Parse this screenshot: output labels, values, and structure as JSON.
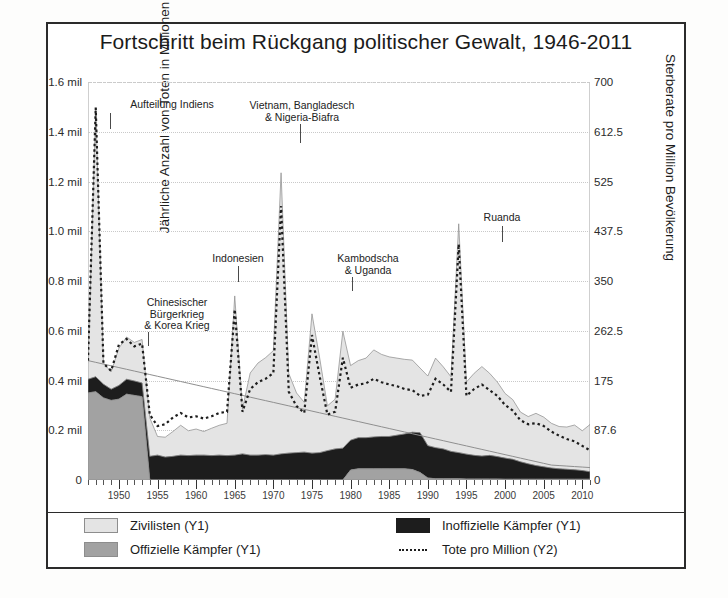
{
  "chart_data": {
    "type": "area",
    "title": "Fortschritt beim Rückgang politischer Gewalt, 1946-2011",
    "xlabel": "",
    "ylabel": "Jährliche Anzahl von Toten in Millionen",
    "ylabel_right": "Sterberate pro Million Bevölkerung",
    "xlim": [
      1946,
      2011
    ],
    "ylim": [
      0,
      1600000
    ],
    "ylim_right": [
      0,
      700
    ],
    "grid": true,
    "legend_position": "bottom",
    "y_ticks_left": [
      "0",
      "0.2 mil",
      "0.4 mil",
      "0.6 mil",
      "0.8 mil",
      "1.0 mil",
      "1.2 mil",
      "1.4 mil",
      "1.6 mil"
    ],
    "y_tick_values_left": [
      0,
      200000,
      400000,
      600000,
      800000,
      1000000,
      1200000,
      1400000,
      1600000
    ],
    "y_ticks_right": [
      "0",
      "87.6",
      "175",
      "262.5",
      "350",
      "437.5",
      "525",
      "612.5",
      "700"
    ],
    "y_tick_values_right": [
      0,
      87.6,
      175,
      262.5,
      350,
      437.5,
      525,
      612.5,
      700
    ],
    "x_ticks": [
      "1950",
      "1955",
      "1960",
      "1965",
      "1970",
      "1975",
      "1980",
      "1985",
      "1990",
      "1995",
      "2000",
      "2005",
      "2010"
    ],
    "x_tick_values": [
      1950,
      1955,
      1960,
      1965,
      1970,
      1975,
      1980,
      1985,
      1990,
      1995,
      2000,
      2005,
      2010
    ],
    "x": [
      1946,
      1947,
      1948,
      1949,
      1950,
      1951,
      1952,
      1953,
      1954,
      1955,
      1956,
      1957,
      1958,
      1959,
      1960,
      1961,
      1962,
      1963,
      1964,
      1965,
      1966,
      1967,
      1968,
      1969,
      1970,
      1971,
      1972,
      1973,
      1974,
      1975,
      1976,
      1977,
      1978,
      1979,
      1980,
      1981,
      1982,
      1983,
      1984,
      1985,
      1986,
      1987,
      1988,
      1989,
      1990,
      1991,
      1992,
      1993,
      1994,
      1995,
      1996,
      1997,
      1998,
      1999,
      2000,
      2001,
      2002,
      2003,
      2004,
      2005,
      2006,
      2007,
      2008,
      2009,
      2010,
      2011
    ],
    "series": [
      {
        "name": "Offizielle Kämpfer (Y1)",
        "key": "official",
        "color": "#a2a2a2",
        "axis": "Y1",
        "values": [
          350000,
          355000,
          330000,
          320000,
          325000,
          345000,
          340000,
          335000,
          0,
          0,
          0,
          0,
          0,
          0,
          0,
          0,
          0,
          0,
          0,
          0,
          0,
          0,
          0,
          0,
          0,
          0,
          0,
          0,
          0,
          0,
          0,
          0,
          0,
          0,
          40000,
          45000,
          45000,
          45000,
          45000,
          45000,
          45000,
          45000,
          42000,
          30000,
          8000,
          5000,
          5000,
          5000,
          5000,
          4000,
          4000,
          4000,
          4000,
          4000,
          3000,
          3000,
          3000,
          3000,
          3000,
          3000,
          3000,
          3000,
          3000,
          3000,
          3000,
          3000
        ]
      },
      {
        "name": "Inoffizielle Kämpfer (Y1)",
        "key": "unofficial",
        "color": "#1d1d1d",
        "axis": "Y1",
        "values": [
          55000,
          60000,
          55000,
          45000,
          55000,
          60000,
          58000,
          55000,
          95000,
          100000,
          92000,
          95000,
          100000,
          98000,
          100000,
          100000,
          98000,
          100000,
          98000,
          100000,
          105000,
          100000,
          100000,
          102000,
          100000,
          105000,
          108000,
          110000,
          112000,
          108000,
          110000,
          118000,
          125000,
          128000,
          120000,
          125000,
          125000,
          128000,
          130000,
          130000,
          135000,
          140000,
          150000,
          160000,
          130000,
          125000,
          120000,
          110000,
          105000,
          100000,
          95000,
          92000,
          95000,
          90000,
          85000,
          80000,
          70000,
          62000,
          55000,
          50000,
          45000,
          42000,
          40000,
          38000,
          35000,
          30000
        ]
      },
      {
        "name": "Zivilisten (Y1)",
        "key": "civilians",
        "color": "#e4e4e4",
        "axis": "Y1",
        "values": [
          60000,
          1080000,
          85000,
          70000,
          150000,
          170000,
          155000,
          175000,
          155000,
          75000,
          80000,
          100000,
          120000,
          100000,
          105000,
          95000,
          110000,
          120000,
          130000,
          640000,
          180000,
          330000,
          370000,
          390000,
          420000,
          1130000,
          320000,
          240000,
          200000,
          560000,
          380000,
          180000,
          200000,
          470000,
          300000,
          310000,
          320000,
          350000,
          330000,
          320000,
          310000,
          300000,
          290000,
          260000,
          280000,
          360000,
          330000,
          300000,
          920000,
          290000,
          330000,
          360000,
          330000,
          300000,
          260000,
          240000,
          200000,
          190000,
          210000,
          200000,
          180000,
          170000,
          170000,
          180000,
          160000,
          190000
        ]
      },
      {
        "name": "Tote pro Million (Y2)",
        "key": "rate",
        "color": "#1d1d1d",
        "axis": "Y2",
        "style": "dotted",
        "values": [
          210,
          655,
          205,
          192,
          238,
          248,
          235,
          240,
          115,
          95,
          98,
          110,
          118,
          110,
          112,
          108,
          112,
          118,
          120,
          300,
          120,
          160,
          172,
          178,
          188,
          482,
          155,
          130,
          118,
          255,
          182,
          115,
          120,
          215,
          162,
          168,
          170,
          178,
          172,
          168,
          165,
          160,
          158,
          148,
          150,
          178,
          168,
          155,
          415,
          148,
          160,
          168,
          158,
          148,
          132,
          122,
          105,
          98,
          100,
          95,
          85,
          78,
          72,
          68,
          60,
          52
        ]
      },
      {
        "name": "Trendlinie",
        "key": "trend",
        "color": "#8f8f8f",
        "axis": "Y1",
        "style": "solid-thin",
        "values": [
          480000,
          473000,
          466000,
          459000,
          452000,
          445000,
          438000,
          431000,
          424000,
          417000,
          410000,
          403000,
          396000,
          389000,
          382000,
          375000,
          368000,
          361000,
          354000,
          347000,
          340000,
          333000,
          326000,
          319000,
          312000,
          305000,
          298000,
          291000,
          284000,
          277000,
          270000,
          263000,
          256000,
          249000,
          242000,
          235000,
          228000,
          221000,
          214000,
          207000,
          200000,
          193000,
          186000,
          179000,
          172000,
          165000,
          158000,
          151000,
          144000,
          137000,
          130000,
          123000,
          116000,
          109000,
          102000,
          95000,
          88000,
          81000,
          74000,
          67000,
          60000,
          58000,
          56000,
          54000,
          52000,
          50000
        ]
      }
    ],
    "annotations": [
      {
        "id": "aufteilung-indiens",
        "text": "Aufteilung Indiens",
        "year": 1947,
        "label_x": 112,
        "label_y": 99,
        "label_w": 120,
        "line_top": 113,
        "line_height": 16,
        "line_x": 110
      },
      {
        "id": "chinesischer-buergerkrieg",
        "text": "Chinesischer\nBürgerkrieg\n& Korea Krieg",
        "year": 1950,
        "label_x": 122,
        "label_y": 297,
        "label_w": 110,
        "line_top": 332,
        "line_height": 14,
        "line_x": 148
      },
      {
        "id": "vietnam-bangladesch",
        "text": "Vietnam, Bangladesch\n& Nigeria-Biafra",
        "year": 1971,
        "label_x": 227,
        "label_y": 100,
        "label_w": 150,
        "line_top": 124,
        "line_height": 19,
        "line_x": 300
      },
      {
        "id": "indonesien",
        "text": "Indonesien",
        "year": 1965,
        "label_x": 198,
        "label_y": 253,
        "label_w": 80,
        "line_top": 266,
        "line_height": 16,
        "line_x": 238
      },
      {
        "id": "kambodscha-uganda",
        "text": "Kambodscha\n& Uganda",
        "year": 1975,
        "label_x": 318,
        "label_y": 253,
        "label_w": 100,
        "line_top": 277,
        "line_height": 14,
        "line_x": 352
      },
      {
        "id": "ruanda",
        "text": "Ruanda",
        "year": 1994,
        "label_x": 470,
        "label_y": 212,
        "label_w": 64,
        "line_top": 226,
        "line_height": 16,
        "line_x": 502
      }
    ],
    "legend": [
      {
        "id": "legend-civilians",
        "label": "Zivilisten (Y1)",
        "swatch": "sw-civ",
        "type": "box"
      },
      {
        "id": "legend-unofficial",
        "label": "Inoffizielle Kämpfer (Y1)",
        "swatch": "sw-uno",
        "type": "box"
      },
      {
        "id": "legend-official",
        "label": "Offizielle Kämpfer (Y1)",
        "swatch": "sw-off",
        "type": "box"
      },
      {
        "id": "legend-rate",
        "label": "Tote pro Million (Y2)",
        "swatch": "dotsw",
        "type": "dotted"
      }
    ]
  }
}
